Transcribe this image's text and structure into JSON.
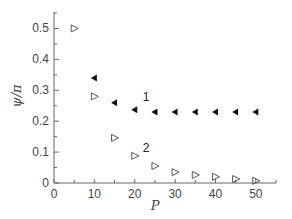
{
  "chart_data": {
    "type": "scatter",
    "title": "",
    "xlabel": "P",
    "ylabel": "ψ/π",
    "xlim": [
      0,
      55
    ],
    "ylim": [
      0,
      0.55
    ],
    "xticks": [
      0,
      10,
      20,
      30,
      40,
      50
    ],
    "yticks": [
      0,
      0.1,
      0.2,
      0.3,
      0.4,
      0.5
    ],
    "xtick_labels": [
      "0",
      "10",
      "20",
      "30",
      "40",
      "50"
    ],
    "ytick_labels": [
      "0",
      "0.1",
      "0.2",
      "0.3",
      "0.4",
      "0.5"
    ],
    "grid": false,
    "legend": "inline labels",
    "series": [
      {
        "name": "1",
        "marker": "filled left-pointing triangle",
        "color": "#111111",
        "x": [
          10,
          15,
          20,
          25,
          30,
          35,
          40,
          45,
          50
        ],
        "values": [
          0.34,
          0.26,
          0.237,
          0.23,
          0.23,
          0.23,
          0.23,
          0.23,
          0.23
        ],
        "label_pos": {
          "x": 22,
          "y": 0.265
        }
      },
      {
        "name": "2",
        "marker": "open right-pointing triangle",
        "color": "#444444",
        "x": [
          5,
          10,
          15,
          20,
          25,
          30,
          35,
          40,
          45,
          50
        ],
        "values": [
          0.5,
          0.28,
          0.146,
          0.088,
          0.055,
          0.035,
          0.026,
          0.02,
          0.013,
          0.007
        ],
        "label_pos": {
          "x": 22,
          "y": 0.1
        }
      }
    ]
  }
}
